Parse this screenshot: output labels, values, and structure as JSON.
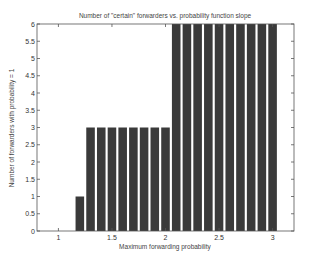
{
  "chart_data": {
    "type": "bar",
    "title": "Number of \"certain\" forwarders vs. probability function slope",
    "xlabel": "Maximum forwarding probability",
    "ylabel": "Number of forwarders with probability = 1",
    "x": [
      1.2,
      1.3,
      1.4,
      1.5,
      1.6,
      1.7,
      1.8,
      1.9,
      2.0,
      2.1,
      2.2,
      2.3,
      2.4,
      2.5,
      2.6,
      2.7,
      2.8,
      2.9,
      3.0
    ],
    "values": [
      1,
      3,
      3,
      3,
      3,
      3,
      3,
      3,
      3,
      6,
      6,
      6,
      6,
      6,
      6,
      6,
      6,
      6,
      6
    ],
    "xlim": [
      0.8,
      3.2
    ],
    "ylim": [
      0,
      6
    ],
    "xticks": [
      1,
      1.5,
      2,
      2.5,
      3
    ],
    "xtick_labels": [
      "1",
      "1.5",
      "2",
      "2.5",
      "3"
    ],
    "yticks": [
      0,
      0.5,
      1,
      1.5,
      2,
      2.5,
      3,
      3.5,
      4,
      4.5,
      5,
      5.5,
      6
    ],
    "ytick_labels": [
      "0",
      "0.5",
      "1",
      "1.5",
      "2",
      "2.5",
      "3",
      "3.5",
      "4",
      "4.5",
      "5",
      "5.5",
      "6"
    ],
    "bar_width": 0.08,
    "bar_color": "#3a3a3a",
    "grid": false,
    "legend": null
  }
}
